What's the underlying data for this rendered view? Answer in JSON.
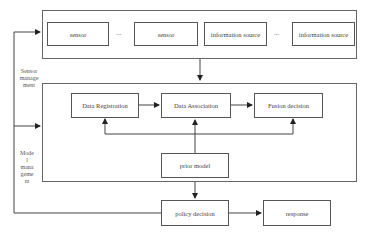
{
  "diagram": {
    "sources": {
      "items": [
        {
          "label": "sensor"
        },
        {
          "label": "sensor"
        },
        {
          "label": "information source"
        },
        {
          "label": "information source"
        }
      ],
      "ellipsis": "..."
    },
    "processing": {
      "data_registration": "Data Registration",
      "data_association": "Data Association",
      "fusion_decision": "Fusion decision",
      "prior_model": "prior model"
    },
    "output": {
      "policy_decision": "policy decision",
      "response": "response"
    },
    "feedback_labels": {
      "sensor_management": [
        "Sensor",
        "manage",
        "ment"
      ],
      "model_management": [
        "Mode",
        "l",
        "mana",
        "geme",
        "nt"
      ]
    },
    "colors": {
      "line": "#444444",
      "box_border": "#555555",
      "background": "#ffffff"
    }
  }
}
